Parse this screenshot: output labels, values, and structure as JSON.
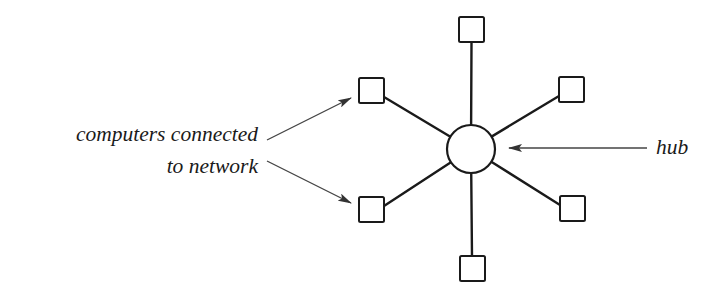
{
  "diagram": {
    "type": "star-network-topology",
    "colors": {
      "stroke": "#1a1a1a",
      "arrow": "#444444",
      "background": "#ffffff",
      "node_fill": "#ffffff"
    },
    "hub": {
      "cx": 471,
      "cy": 149,
      "r": 24
    },
    "nodes": [
      {
        "id": "top",
        "x": 459,
        "y": 17,
        "size": 25,
        "lx": 471.5,
        "ly": 43
      },
      {
        "id": "upper-left",
        "x": 359,
        "y": 78,
        "size": 25,
        "lx": 384,
        "ly": 97
      },
      {
        "id": "upper-right",
        "x": 559,
        "y": 77,
        "size": 25,
        "lx": 559,
        "ly": 96
      },
      {
        "id": "lower-left",
        "x": 359,
        "y": 197,
        "size": 25,
        "lx": 384,
        "ly": 206
      },
      {
        "id": "lower-right",
        "x": 560,
        "y": 196,
        "size": 25,
        "lx": 560,
        "ly": 205
      },
      {
        "id": "bottom",
        "x": 460,
        "y": 256,
        "size": 25,
        "lx": 472,
        "ly": 256
      }
    ],
    "labels": {
      "computers_line1": "computers connected",
      "computers_line2": "to network",
      "hub": "hub"
    },
    "arrows": [
      {
        "id": "to-upper-left-computer",
        "x1": 267,
        "y1": 140,
        "x2": 351,
        "y2": 98
      },
      {
        "id": "to-lower-left-computer",
        "x1": 267,
        "y1": 161,
        "x2": 351,
        "y2": 203
      },
      {
        "id": "to-hub",
        "x1": 647,
        "y1": 148,
        "x2": 509,
        "y2": 148
      }
    ]
  }
}
